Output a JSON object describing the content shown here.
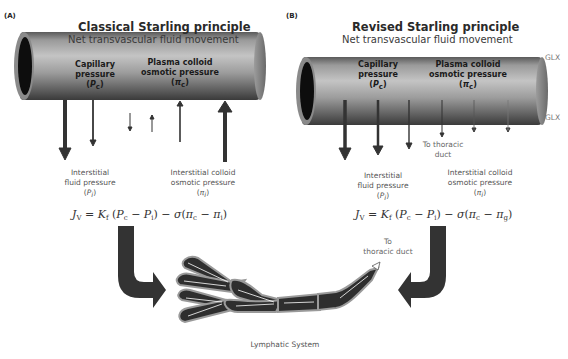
{
  "panels": {
    "a": {
      "label": "(A)",
      "title": "Classical Starling principle",
      "subtitle": "Net transvascular fluid movement",
      "capillary_pressure": {
        "line1": "Capillary",
        "line2": "pressure",
        "symbol": "P",
        "subscript": "c"
      },
      "plasma_colloid": {
        "line1": "Plasma colloid",
        "line2": "osmotic pressure",
        "symbol": "π",
        "subscript": "c"
      },
      "interstitial_fluid": {
        "line1": "Interstitial",
        "line2": "fluid pressure",
        "symbol": "P",
        "subscript": "i"
      },
      "interstitial_colloid": {
        "line1": "Interstitial colloid",
        "line2": "osmotic pressure",
        "symbol": "π",
        "subscript": "i"
      },
      "formula": {
        "lhs": "J",
        "lhs_sub": "V",
        "eq": " = ",
        "k": "K",
        "k_sub": "f",
        "open": " (",
        "pc": "P",
        "pc_sub": "c",
        "minus1": " − ",
        "pi_sym": "P",
        "pi_sub": "i",
        "mid": ") − ",
        "sigma": "σ",
        "open2": "(",
        "pic": "π",
        "pic_sub": "c",
        "minus2": " − ",
        "last": "π",
        "last_sub": "i",
        "close": ")"
      }
    },
    "b": {
      "label": "(B)",
      "title": "Revised Starling principle",
      "subtitle": "Net transvascular fluid movement",
      "glx_top": "GLX",
      "glx_bottom": "GLX",
      "capillary_pressure": {
        "line1": "Capillary",
        "line2": "pressure",
        "symbol": "P",
        "subscript": "c"
      },
      "plasma_colloid": {
        "line1": "Plasma colloid",
        "line2": "osmotic pressure",
        "symbol": "π",
        "subscript": "c"
      },
      "to_thoracic_duct": {
        "line1": "To thoracic",
        "line2": "duct"
      },
      "interstitial_fluid": {
        "line1": "Interstitial",
        "line2": "fluid pressure",
        "symbol": "P",
        "subscript": "i"
      },
      "interstitial_colloid": {
        "line1": "Interstitial colloid",
        "line2": "osmotic pressure",
        "symbol": "π",
        "subscript": "i"
      },
      "formula": {
        "lhs": "J",
        "lhs_sub": "V",
        "eq": " = ",
        "k": "K",
        "k_sub": "f",
        "open": " (",
        "pc": "P",
        "pc_sub": "c",
        "minus1": " − ",
        "pi_sym": "P",
        "pi_sub": "i",
        "mid": ") − ",
        "sigma": "σ",
        "open2": "(",
        "pic": "π",
        "pic_sub": "c",
        "minus2": " − ",
        "last": "π",
        "last_sub": "g",
        "close": ")"
      }
    }
  },
  "lymphatic": {
    "label": "Lymphatic System",
    "to_thoracic_duct": {
      "line1": "To",
      "line2": "thoracic duct"
    }
  },
  "colors": {
    "vessel_dark": "#3a3a3a",
    "vessel_light": "#b5b5b5",
    "arrow": "#333333",
    "lymph_fill": "#2e2e2e",
    "lymph_border": "#9a9a9a"
  }
}
